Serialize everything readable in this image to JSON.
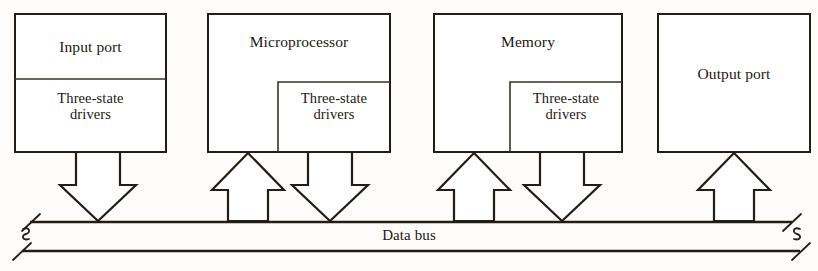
{
  "diagram": {
    "bus": {
      "label": "Data bus",
      "line_color": "#241c17",
      "break_marks": [
        "left",
        "right"
      ]
    },
    "units": [
      {
        "id": "input-port",
        "name": "Input port",
        "driver_label": "Three-state\ndrivers",
        "driver_style": "full-width-section",
        "connections": [
          {
            "type": "arrow",
            "direction": "down",
            "meaning": "drives data onto bus"
          }
        ]
      },
      {
        "id": "microprocessor",
        "name": "Microprocessor",
        "driver_label": "Three-state\ndrivers",
        "driver_style": "inset-box-bottom-right",
        "connections": [
          {
            "type": "arrow",
            "direction": "up",
            "meaning": "reads data from bus"
          },
          {
            "type": "arrow",
            "direction": "down",
            "meaning": "drives data onto bus"
          }
        ]
      },
      {
        "id": "memory",
        "name": "Memory",
        "driver_label": "Three-state\ndrivers",
        "driver_style": "inset-box-bottom-right",
        "connections": [
          {
            "type": "arrow",
            "direction": "up",
            "meaning": "reads data from bus"
          },
          {
            "type": "arrow",
            "direction": "down",
            "meaning": "drives data onto bus"
          }
        ]
      },
      {
        "id": "output-port",
        "name": "Output port",
        "driver_label": "",
        "driver_style": "none",
        "connections": [
          {
            "type": "arrow",
            "direction": "up",
            "meaning": "reads data from bus"
          }
        ]
      }
    ]
  }
}
